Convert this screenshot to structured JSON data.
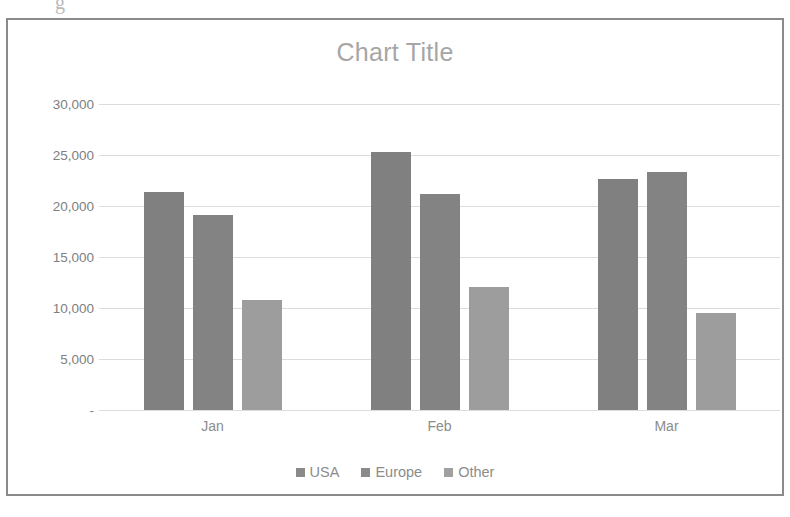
{
  "scan_artifact": "g",
  "chart_data": {
    "type": "bar",
    "title": "Chart Title",
    "xlabel": "",
    "ylabel": "",
    "categories": [
      "Jan",
      "Feb",
      "Mar"
    ],
    "series": [
      {
        "name": "USA",
        "color": "#808080",
        "values": [
          21400,
          25300,
          22600
        ]
      },
      {
        "name": "Europe",
        "color": "#838383",
        "values": [
          19100,
          21200,
          23300
        ]
      },
      {
        "name": "Other",
        "color": "#9d9d9d",
        "values": [
          10800,
          12100,
          9500
        ]
      }
    ],
    "ylim": [
      0,
      30000
    ],
    "ytick_values": [
      30000,
      25000,
      20000,
      15000,
      10000,
      5000,
      0
    ],
    "ytick_labels": [
      "30,000",
      "25,000",
      "20,000",
      "15,000",
      "10,000",
      "5,000",
      "-"
    ],
    "grid": true,
    "legend_position": "bottom",
    "title_color": "#a6a6a6",
    "gridline_color": "#dcdcdc",
    "axis_text_color": "#808080"
  }
}
